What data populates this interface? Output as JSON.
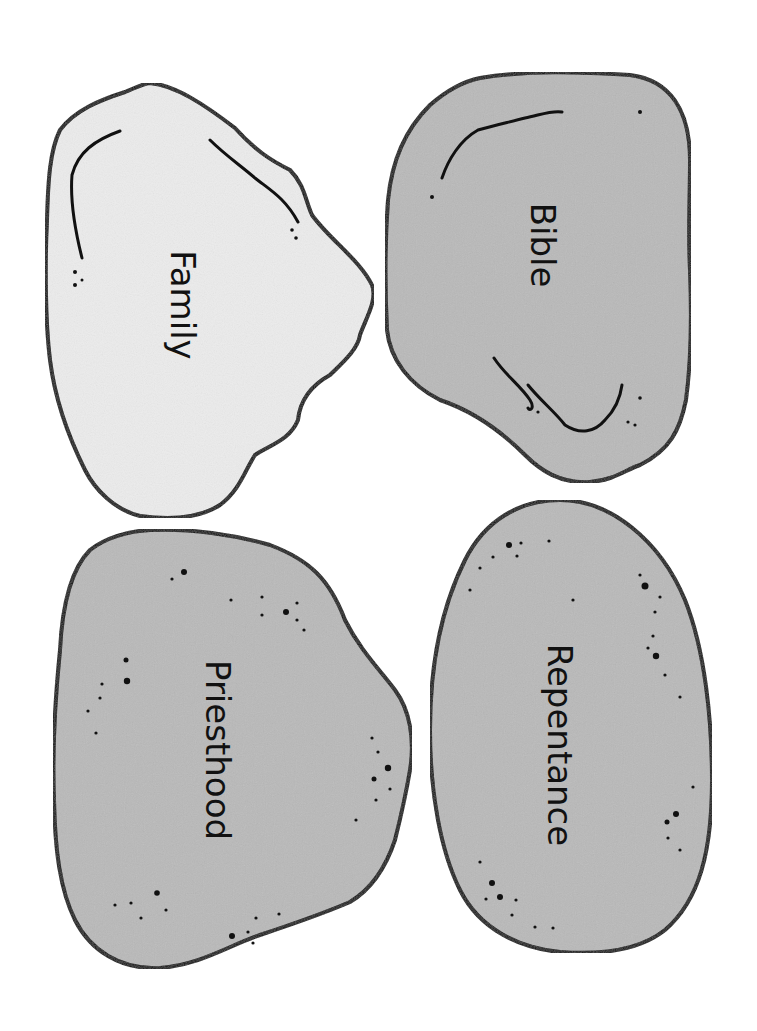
{
  "colors": {
    "outline": "#111111",
    "light_fill": "#ececec",
    "dark_fill": "#b9b9b9",
    "background": "#ffffff"
  },
  "stones": [
    {
      "id": "family",
      "label": "Family",
      "fill": "light"
    },
    {
      "id": "bible",
      "label": "Bible",
      "fill": "dark"
    },
    {
      "id": "priesthood",
      "label": "Priesthood",
      "fill": "dark"
    },
    {
      "id": "repentance",
      "label": "Repentance",
      "fill": "dark"
    }
  ]
}
